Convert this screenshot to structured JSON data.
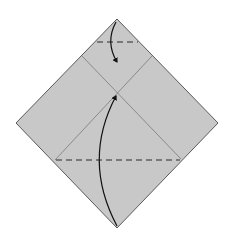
{
  "diagram": {
    "type": "origami-fold-step",
    "colors": {
      "background": "#ffffff",
      "paper": "#c8c8c8",
      "edge": "#5a5a5a",
      "crease": "#8a8a8a",
      "fold_line": "#2a2a2a",
      "arrow": "#111111"
    },
    "paper_square": {
      "top": [
        117,
        19
      ],
      "right": [
        218,
        123
      ],
      "bottom": [
        117,
        228
      ],
      "left": [
        16,
        123
      ]
    },
    "creases": [
      {
        "from": [
          82,
          56
        ],
        "to": [
          181,
          159
        ]
      },
      {
        "from": [
          152,
          56
        ],
        "to": [
          55,
          160
        ]
      }
    ],
    "valley_folds": [
      {
        "name": "top-corner-fold",
        "from": [
          97,
          42
        ],
        "to": [
          138,
          42
        ]
      },
      {
        "name": "bottom-corner-fold",
        "from": [
          56,
          160
        ],
        "to": [
          180,
          160
        ]
      }
    ],
    "arrows": [
      {
        "name": "top-corner-arrow",
        "start": [
          116,
          22
        ],
        "control": [
          105,
          42
        ],
        "end": [
          117,
          62
        ]
      },
      {
        "name": "bottom-corner-arrow",
        "start": [
          117,
          226
        ],
        "control": [
          82,
          160
        ],
        "end": [
          116,
          96
        ]
      }
    ]
  }
}
